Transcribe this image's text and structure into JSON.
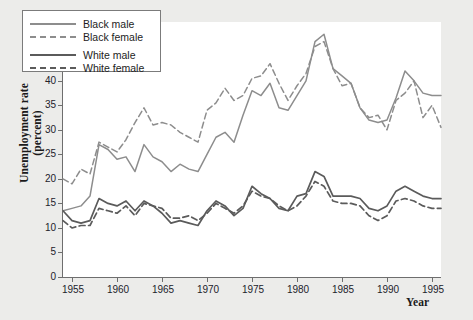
{
  "chart_data": {
    "type": "line",
    "title": "",
    "xlabel": "Year",
    "ylabel": "Unemployment rate (percent)",
    "xlim": [
      1954,
      1996
    ],
    "ylim": [
      0,
      52
    ],
    "yticks": [
      0,
      5,
      10,
      15,
      20,
      25,
      30,
      35,
      40,
      45,
      50
    ],
    "xticks": [
      1955,
      1960,
      1965,
      1970,
      1975,
      1980,
      1985,
      1990,
      1995
    ],
    "grid": false,
    "legend_position": "upper-left",
    "x": [
      1954,
      1955,
      1956,
      1957,
      1958,
      1959,
      1960,
      1961,
      1962,
      1963,
      1964,
      1965,
      1966,
      1967,
      1968,
      1969,
      1970,
      1971,
      1972,
      1973,
      1974,
      1975,
      1976,
      1977,
      1978,
      1979,
      1980,
      1981,
      1982,
      1983,
      1984,
      1985,
      1986,
      1987,
      1988,
      1989,
      1990,
      1991,
      1992,
      1993,
      1994,
      1995,
      1996
    ],
    "series": [
      {
        "name": "Black male",
        "style": "solid",
        "color": "#8d8d8d",
        "values": [
          13.5,
          14.0,
          14.5,
          16.5,
          27.0,
          26.0,
          24.0,
          24.5,
          21.5,
          27.0,
          24.5,
          23.5,
          21.5,
          23.0,
          22.0,
          21.5,
          25.0,
          28.5,
          29.5,
          27.5,
          33.0,
          38.0,
          37.0,
          39.5,
          34.5,
          34.0,
          37.0,
          40.0,
          48.0,
          49.5,
          42.5,
          41.0,
          39.5,
          34.5,
          32.0,
          31.5,
          32.0,
          36.5,
          42.0,
          40.0,
          37.5,
          37.0,
          37.0
        ]
      },
      {
        "name": "Black female",
        "style": "dashed",
        "color": "#8d8d8d",
        "values": [
          20.0,
          19.0,
          22.0,
          21.0,
          27.5,
          26.5,
          25.5,
          28.0,
          31.5,
          34.5,
          31.0,
          31.5,
          31.0,
          29.5,
          28.5,
          27.5,
          34.0,
          35.5,
          38.5,
          36.0,
          37.0,
          40.5,
          41.0,
          43.5,
          39.5,
          36.0,
          39.0,
          41.5,
          47.0,
          48.0,
          42.5,
          39.0,
          39.5,
          34.5,
          32.5,
          33.0,
          30.0,
          36.0,
          37.5,
          40.0,
          32.5,
          35.0,
          30.5
        ]
      },
      {
        "name": "White male",
        "style": "solid",
        "color": "#5b5b5b",
        "values": [
          13.5,
          11.5,
          11.0,
          11.5,
          16.0,
          15.0,
          14.5,
          15.5,
          13.5,
          15.5,
          14.5,
          13.0,
          11.0,
          11.5,
          11.0,
          10.5,
          13.5,
          15.5,
          14.5,
          12.5,
          14.0,
          18.5,
          17.0,
          16.0,
          14.0,
          13.5,
          16.5,
          17.0,
          21.5,
          20.5,
          16.5,
          16.5,
          16.5,
          16.0,
          14.0,
          13.5,
          14.5,
          17.5,
          18.5,
          17.5,
          16.5,
          16.0,
          16.0
        ]
      },
      {
        "name": "White female",
        "style": "dashed",
        "color": "#5b5b5b",
        "values": [
          11.5,
          10.0,
          10.5,
          10.5,
          14.0,
          13.5,
          13.0,
          14.5,
          12.5,
          15.0,
          14.5,
          14.0,
          12.0,
          12.0,
          12.5,
          11.5,
          13.0,
          15.0,
          14.0,
          13.0,
          14.5,
          17.5,
          16.5,
          16.0,
          14.5,
          13.5,
          14.5,
          16.5,
          19.5,
          18.5,
          15.5,
          15.0,
          15.0,
          14.5,
          12.5,
          11.5,
          12.5,
          15.5,
          16.0,
          15.5,
          14.5,
          14.0,
          14.0
        ]
      }
    ]
  },
  "axes": {
    "ylabel_line1": "Unemployment rate",
    "ylabel_line2": "(percent)",
    "xlabel": "Year"
  },
  "legend": {
    "items": [
      {
        "label": "Black male",
        "key": "legend-key-black-male"
      },
      {
        "label": "Black female",
        "key": "legend-key-black-female"
      },
      {
        "label": "White male",
        "key": "legend-key-white-male"
      },
      {
        "label": "White female",
        "key": "legend-key-white-female"
      }
    ]
  }
}
